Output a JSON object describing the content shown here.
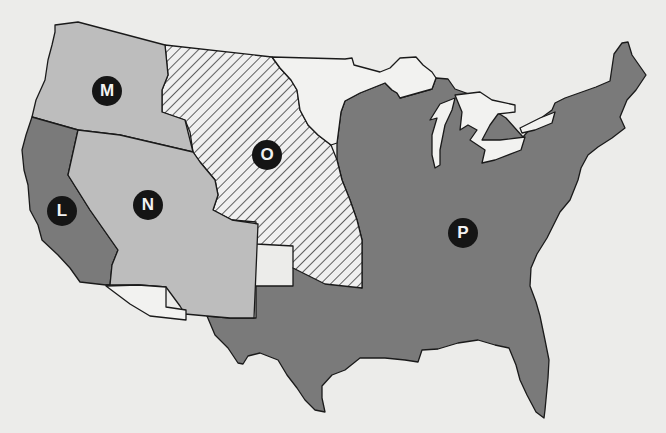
{
  "map": {
    "title": "",
    "colors": {
      "background": "#ececea",
      "region_L": "#7a7a7a",
      "region_M": "#bdbdbd",
      "region_N": "#bdbdbd",
      "region_O_hatch": "#f0f0f0",
      "region_P": "#7a7a7a",
      "unlabeled_white": "#f2f2f0",
      "outline": "#1a1a1a",
      "marker_bg": "#151515",
      "marker_text": "#f2f2f2"
    },
    "regions": [
      {
        "id": "L",
        "label": "L",
        "fill": "dark-gray",
        "x": 62,
        "y": 211
      },
      {
        "id": "M",
        "label": "M",
        "fill": "light-gray",
        "x": 107,
        "y": 91
      },
      {
        "id": "N",
        "label": "N",
        "fill": "light-gray",
        "x": 148,
        "y": 205
      },
      {
        "id": "O",
        "label": "O",
        "fill": "hatched",
        "x": 267,
        "y": 155
      },
      {
        "id": "P",
        "label": "P",
        "fill": "dark-gray",
        "x": 463,
        "y": 233
      }
    ],
    "unlabeled_regions": [
      {
        "name": "northern-white-region",
        "fill": "white"
      },
      {
        "name": "southern-white-strip",
        "fill": "white"
      }
    ]
  }
}
